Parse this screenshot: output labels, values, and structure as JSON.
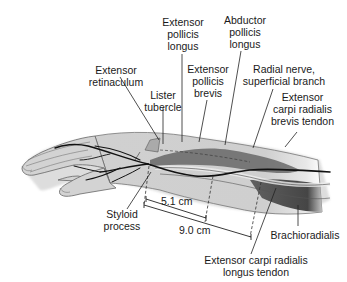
{
  "figure": {
    "labels": {
      "extensor_pollicis_longus": "Extensor\npollicis\nlongus",
      "abductor_pollicis_longus": "Abductor\npollicis\nlongus",
      "extensor_retinaculum": "Extensor\nretinaculum",
      "lister_tubercle": "Lister\ntubercle",
      "extensor_pollicis_brevis": "Extensor\npollicis\nbrevis",
      "radial_nerve": "Radial nerve,\nsuperficial branch",
      "ecrb_tendon": "Extensor\ncarpi radialis\nbrevis tendon",
      "styloid_process": "Styloid\nprocess",
      "brachioradialis": "Brachioradialis",
      "ecrl_tendon": "Extensor carpi radialis\nlongus tendon"
    },
    "measurements": {
      "short": "5.1 cm",
      "long": "9.0 cm"
    },
    "colors": {
      "skin": "#d2d2d2",
      "outline": "#555555",
      "nerve": "#111111",
      "muscle_dark": "#3a3a3a",
      "leader": "#222222"
    }
  }
}
